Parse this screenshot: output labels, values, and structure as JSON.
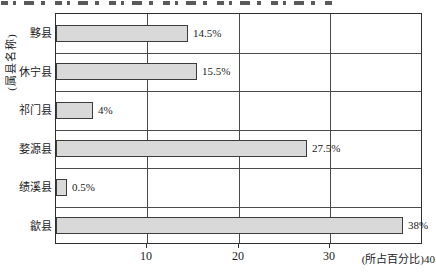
{
  "figure": {
    "background": "#ffffff",
    "top_text_cropped": true
  },
  "chart_data": {
    "type": "bar",
    "orientation": "horizontal",
    "title": "",
    "ylabel": "(属县名称)",
    "xlabel": "(所占百分比)",
    "x_axis_right_label": "(所占百分比)40",
    "categories": [
      "黟县",
      "休宁县",
      "祁门县",
      "婺源县",
      "绩溪县",
      "歙县"
    ],
    "values": [
      14.5,
      15.5,
      4,
      27.5,
      0.5,
      38
    ],
    "value_labels": [
      "14.5%",
      "15.5%",
      "4%",
      "27.5%",
      "0.5%",
      "38%"
    ],
    "x_ticks": [
      "10",
      "20",
      "30"
    ],
    "x_tick_values": [
      10,
      20,
      30
    ],
    "xlim": [
      0,
      40
    ],
    "grid": true,
    "legend": "none",
    "bar_fill": "#d9d9d9",
    "bar_border": "#3c3c3c",
    "grid_color": "#4a4a4a"
  }
}
